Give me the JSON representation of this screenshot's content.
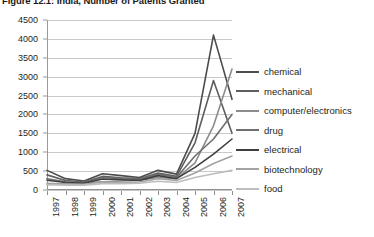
{
  "figure": {
    "title": "Figure 12.1: India, Number of Patents Granted"
  },
  "chart_data": {
    "type": "line",
    "title": "Figure 12.1: India, Number of Patents Granted",
    "xlabel": "",
    "ylabel": "",
    "categories": [
      "1997",
      "1998",
      "1999",
      "2000",
      "2001",
      "2002",
      "2003",
      "2004",
      "2005",
      "2006",
      "2007"
    ],
    "x_tick_labels": [
      "1997",
      "1998",
      "1999",
      "2000",
      "2001",
      "2002",
      "2003",
      "2004",
      "2005",
      "2006",
      "2007"
    ],
    "y_tick_labels": [
      "0",
      "500",
      "1000",
      "1500",
      "2000",
      "2500",
      "3000",
      "3500",
      "4000",
      "4500"
    ],
    "ylim": [
      0,
      4500
    ],
    "y_step": 500,
    "grid": "horizontal",
    "legend_position": "right",
    "series": [
      {
        "name": "chemical",
        "color": "#4c4c4c",
        "values": [
          520,
          300,
          240,
          430,
          380,
          330,
          520,
          420,
          1500,
          4100,
          2400
        ]
      },
      {
        "name": "mechanical",
        "color": "#5e5e5e",
        "values": [
          400,
          250,
          210,
          360,
          320,
          300,
          450,
          360,
          1250,
          2900,
          1500
        ]
      },
      {
        "name": "computer/electronics",
        "color": "#8c8c8c",
        "values": [
          150,
          170,
          190,
          220,
          240,
          260,
          330,
          300,
          720,
          1700,
          3200
        ]
      },
      {
        "name": "drug",
        "color": "#6e6e6e",
        "values": [
          300,
          220,
          200,
          330,
          300,
          280,
          420,
          330,
          900,
          1350,
          2000
        ]
      },
      {
        "name": "electrical",
        "color": "#3f3f3f",
        "values": [
          260,
          200,
          180,
          290,
          270,
          250,
          380,
          300,
          600,
          950,
          1350
        ]
      },
      {
        "name": "biotechnology",
        "color": "#a3a3a3",
        "values": [
          180,
          160,
          150,
          210,
          200,
          210,
          300,
          250,
          450,
          700,
          900
        ]
      },
      {
        "name": "food",
        "color": "#bdbdbd",
        "values": [
          140,
          130,
          130,
          170,
          170,
          180,
          230,
          200,
          330,
          430,
          520
        ]
      }
    ]
  },
  "legend": {
    "items": [
      {
        "label": "chemical"
      },
      {
        "label": "mechanical"
      },
      {
        "label": "computer/electronics"
      },
      {
        "label": "drug"
      },
      {
        "label": "electrical"
      },
      {
        "label": "biotechnology"
      },
      {
        "label": "food"
      }
    ]
  }
}
